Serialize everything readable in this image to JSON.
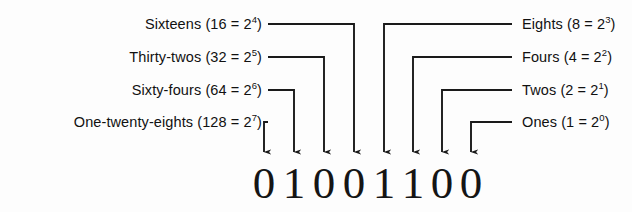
{
  "diagram": {
    "ink_color": "#1a1a1a",
    "background_color": "#fdfdfd",
    "binary_value": "01001100",
    "bits": [
      {
        "digit": "0",
        "place": 128,
        "x": 264
      },
      {
        "digit": "1",
        "place": 64,
        "x": 294
      },
      {
        "digit": "0",
        "place": 32,
        "x": 324
      },
      {
        "digit": "0",
        "place": 16,
        "x": 354
      },
      {
        "digit": "1",
        "place": 8,
        "x": 384
      },
      {
        "digit": "1",
        "place": 4,
        "x": 413
      },
      {
        "digit": "0",
        "place": 2,
        "x": 442
      },
      {
        "digit": "0",
        "place": 1,
        "x": 471
      }
    ],
    "labels_left": [
      {
        "name": "Sixteens",
        "value": "16",
        "exponent": "4",
        "text_x": 262,
        "text_y": 24,
        "dash_x1": 268,
        "dash_x2": 354,
        "drop_x": 354,
        "arrow_y": 152
      },
      {
        "name": "Thirty-twos",
        "value": "32",
        "exponent": "5",
        "text_x": 262,
        "text_y": 57,
        "dash_x1": 268,
        "dash_x2": 324,
        "drop_x": 324,
        "arrow_y": 152
      },
      {
        "name": "Sixty-fours",
        "value": "64",
        "exponent": "6",
        "text_x": 262,
        "text_y": 90,
        "dash_x1": 268,
        "dash_x2": 294,
        "drop_x": 294,
        "arrow_y": 152
      },
      {
        "name": "One-twenty-eights",
        "value": "128",
        "exponent": "7",
        "text_x": 262,
        "text_y": 122,
        "dash_x1": 268,
        "dash_x2": 264,
        "drop_x": 264,
        "arrow_y": 152
      }
    ],
    "labels_right": [
      {
        "name": "Eights",
        "value": "8",
        "exponent": "3",
        "text_x": 522,
        "text_y": 24,
        "dash_x1": 512,
        "dash_x2": 384,
        "drop_x": 384,
        "arrow_y": 152
      },
      {
        "name": "Fours",
        "value": "4",
        "exponent": "2",
        "text_x": 522,
        "text_y": 57,
        "dash_x1": 512,
        "dash_x2": 413,
        "drop_x": 413,
        "arrow_y": 152
      },
      {
        "name": "Twos",
        "value": "2",
        "exponent": "1",
        "text_x": 522,
        "text_y": 90,
        "dash_x1": 512,
        "dash_x2": 442,
        "drop_x": 442,
        "arrow_y": 152
      },
      {
        "name": "Ones",
        "value": "1",
        "exponent": "0",
        "text_x": 522,
        "text_y": 122,
        "dash_x1": 512,
        "dash_x2": 471,
        "drop_x": 471,
        "arrow_y": 152
      }
    ]
  }
}
